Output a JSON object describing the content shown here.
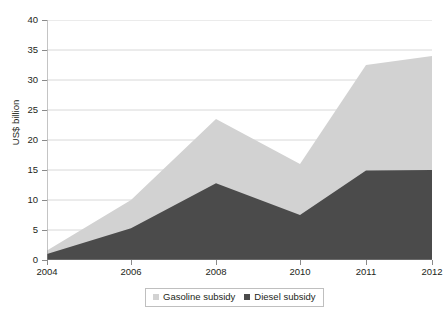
{
  "top_clipped_text": "· ·   · ·      ·        ·",
  "legend": {
    "position": "bottom-center",
    "entries": [
      {
        "label": "Gasoline subsidy",
        "color": "#d2d2d2",
        "swatch_name": "legend-swatch-gasoline"
      },
      {
        "label": "Diesel subsidy",
        "color": "#4b4b4b",
        "swatch_name": "legend-swatch-diesel"
      }
    ]
  },
  "axes": {
    "ylabel": "US$ billion",
    "xlabel": "",
    "yticks": [
      "0",
      "5",
      "10",
      "15",
      "20",
      "25",
      "30",
      "35",
      "40"
    ],
    "xticks": [
      "2004",
      "2006",
      "2008",
      "2010",
      "2011",
      "2012"
    ]
  },
  "chart_data": {
    "type": "area",
    "stacked": true,
    "title": "",
    "subtitle": "",
    "xlabel": "",
    "ylabel": "US$ billion",
    "x": [
      2004,
      2006,
      2008,
      2010,
      2011,
      2012
    ],
    "xtick_labels": [
      "2004",
      "2006",
      "2008",
      "2010",
      "2011",
      "2012"
    ],
    "xlim": [
      2004,
      2012
    ],
    "ylim": [
      0,
      40
    ],
    "ytick_labels": [
      "0",
      "5",
      "10",
      "15",
      "20",
      "25",
      "30",
      "35",
      "40"
    ],
    "ytick_step": 5,
    "grid": "horizontal",
    "legend_position": "bottom-center",
    "series": [
      {
        "name": "Diesel subsidy",
        "color": "#4b4b4b",
        "values": [
          1.0,
          5.3,
          12.8,
          7.5,
          14.9,
          15.0
        ]
      },
      {
        "name": "Gasoline subsidy",
        "color": "#d2d2d2",
        "values": [
          0.6,
          4.7,
          10.7,
          8.5,
          17.6,
          19.0
        ]
      }
    ],
    "totals": [
      1.6,
      10.0,
      23.5,
      16.0,
      32.5,
      34.0
    ]
  }
}
